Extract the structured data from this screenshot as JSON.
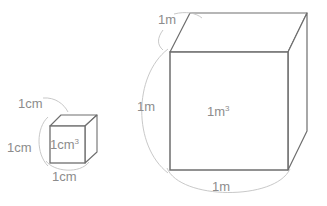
{
  "figure": {
    "background_color": "#ffffff",
    "line_color": "#6e6e6e",
    "leader_color": "#bdbdbd",
    "text_color": "#8c8c8c"
  },
  "small_cube": {
    "name": "1cm cube",
    "volume_label": "1cm",
    "volume_exponent": "3",
    "edge_labels": {
      "top": "1cm",
      "left": "1cm",
      "bottom": "1cm"
    }
  },
  "large_cube": {
    "name": "1m cube",
    "volume_label": "1m",
    "volume_exponent": "3",
    "edge_labels": {
      "top": "1m",
      "left": "1m",
      "bottom": "1m"
    }
  }
}
